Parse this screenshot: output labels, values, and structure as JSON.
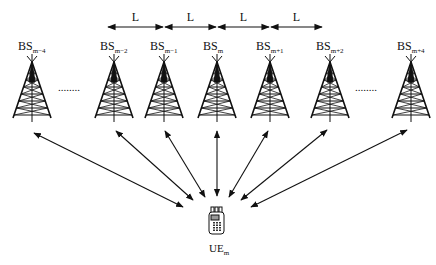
{
  "diagram": {
    "type": "network-topology",
    "spacing_label": "L",
    "spacing_arrows": [
      "L",
      "L",
      "L",
      "L"
    ],
    "base_stations": [
      {
        "id": "bs-m-4",
        "base": "BS",
        "sub": "m-4"
      },
      {
        "id": "bs-m-2",
        "base": "BS",
        "sub": "m-2"
      },
      {
        "id": "bs-m-1",
        "base": "BS",
        "sub": "m-1"
      },
      {
        "id": "bs-m",
        "base": "BS",
        "sub": "m"
      },
      {
        "id": "bs-m+1",
        "base": "BS",
        "sub": "m+1"
      },
      {
        "id": "bs-m+2",
        "base": "BS",
        "sub": "m+2"
      },
      {
        "id": "bs-m+4",
        "base": "BS",
        "sub": "m+4"
      }
    ],
    "ellipsis": [
      "........",
      "........"
    ],
    "user_equipment": {
      "base": "UE",
      "sub": "m",
      "icon": "mobile-phone-icon"
    },
    "links": "bidirectional arrows from each base station to UE",
    "colors": {
      "stroke": "#111111",
      "background": "#ffffff"
    }
  }
}
